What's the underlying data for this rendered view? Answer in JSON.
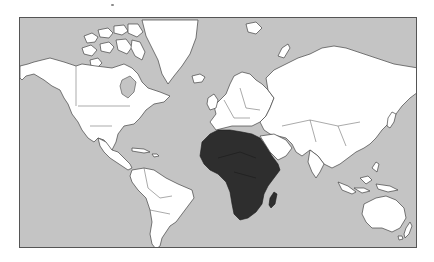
{
  "map": {
    "projection": "mercator",
    "subject": "world map",
    "highlighted_region": "Africa",
    "colors": {
      "ocean": "#c4c4c4",
      "land": "#ffffff",
      "highlight": "#2e2e2e",
      "border": "#444444",
      "frame": "#555555",
      "background": "#ffffff"
    },
    "regions": [
      {
        "name": "North America",
        "highlighted": false
      },
      {
        "name": "Greenland",
        "highlighted": false
      },
      {
        "name": "South America",
        "highlighted": false
      },
      {
        "name": "Europe",
        "highlighted": false
      },
      {
        "name": "Asia",
        "highlighted": false
      },
      {
        "name": "Africa",
        "highlighted": true
      },
      {
        "name": "Madagascar",
        "highlighted": true
      },
      {
        "name": "Australia",
        "highlighted": false
      },
      {
        "name": "New Zealand",
        "highlighted": false
      }
    ]
  }
}
